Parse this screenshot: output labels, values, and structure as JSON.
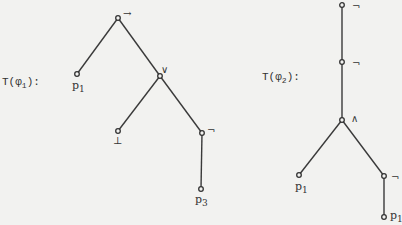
{
  "trees": [
    {
      "title": "T(φ1):",
      "title_main": "T(φ",
      "title_sub": "1",
      "title_end": "):",
      "nodes": [
        {
          "id": "root",
          "label": "→"
        },
        {
          "id": "p1",
          "label": "p",
          "sub": "1"
        },
        {
          "id": "or",
          "label": "∨"
        },
        {
          "id": "bot",
          "label": "⊥"
        },
        {
          "id": "neg",
          "label": "¬"
        },
        {
          "id": "p3",
          "label": "p",
          "sub": "3"
        }
      ],
      "edges": [
        [
          "root",
          "p1"
        ],
        [
          "root",
          "or"
        ],
        [
          "or",
          "bot"
        ],
        [
          "or",
          "neg"
        ],
        [
          "neg",
          "p3"
        ]
      ]
    },
    {
      "title": "T(φ2):",
      "title_main": "T(φ",
      "title_sub": "2",
      "title_end": "):",
      "nodes": [
        {
          "id": "neg1",
          "label": "¬"
        },
        {
          "id": "neg2",
          "label": "¬"
        },
        {
          "id": "and",
          "label": "∧"
        },
        {
          "id": "p1a",
          "label": "p",
          "sub": "1"
        },
        {
          "id": "neg3",
          "label": "¬"
        },
        {
          "id": "p1b",
          "label": "p",
          "sub": "1"
        }
      ],
      "edges": [
        [
          "neg1",
          "neg2"
        ],
        [
          "neg2",
          "and"
        ],
        [
          "and",
          "p1a"
        ],
        [
          "and",
          "neg3"
        ],
        [
          "neg3",
          "p1b"
        ]
      ]
    }
  ]
}
